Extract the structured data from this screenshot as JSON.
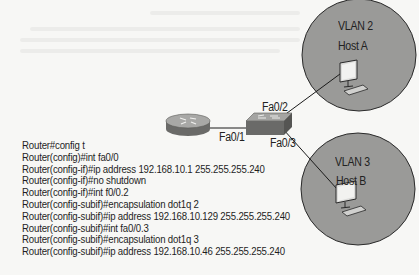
{
  "diagram": {
    "vlans": [
      {
        "name": "VLAN 2",
        "host": "Host A",
        "port": "Fa0/2"
      },
      {
        "name": "VLAN 3",
        "host": "Host B",
        "port": "Fa0/3"
      }
    ],
    "router_port": "Fa0/1",
    "colors": {
      "vlan_fill": "#9a9a98",
      "vlan_stroke": "#2a2a2a",
      "background": "#f7f7f5",
      "link": "#1a1a1a"
    }
  },
  "config": {
    "lines": [
      "Router#config t",
      "Router(config)#int fa0/0",
      "Router(config-if)#ip address 192.168.10.1 255.255.255.240",
      "Router(config-if)#no shutdown",
      "Router(config-if)#int f0/0.2",
      "Router(config-subif)#encapsulation dot1q 2",
      "Router(config-subif)#ip address 192.168.10.129 255.255.255.240",
      "Router(config-subif)#int fa0/0.3",
      "Router(config-subif)#encapsulation dot1q 3",
      "Router(config-subif)#ip address 192.168.10.46 255.255.255.240"
    ]
  }
}
